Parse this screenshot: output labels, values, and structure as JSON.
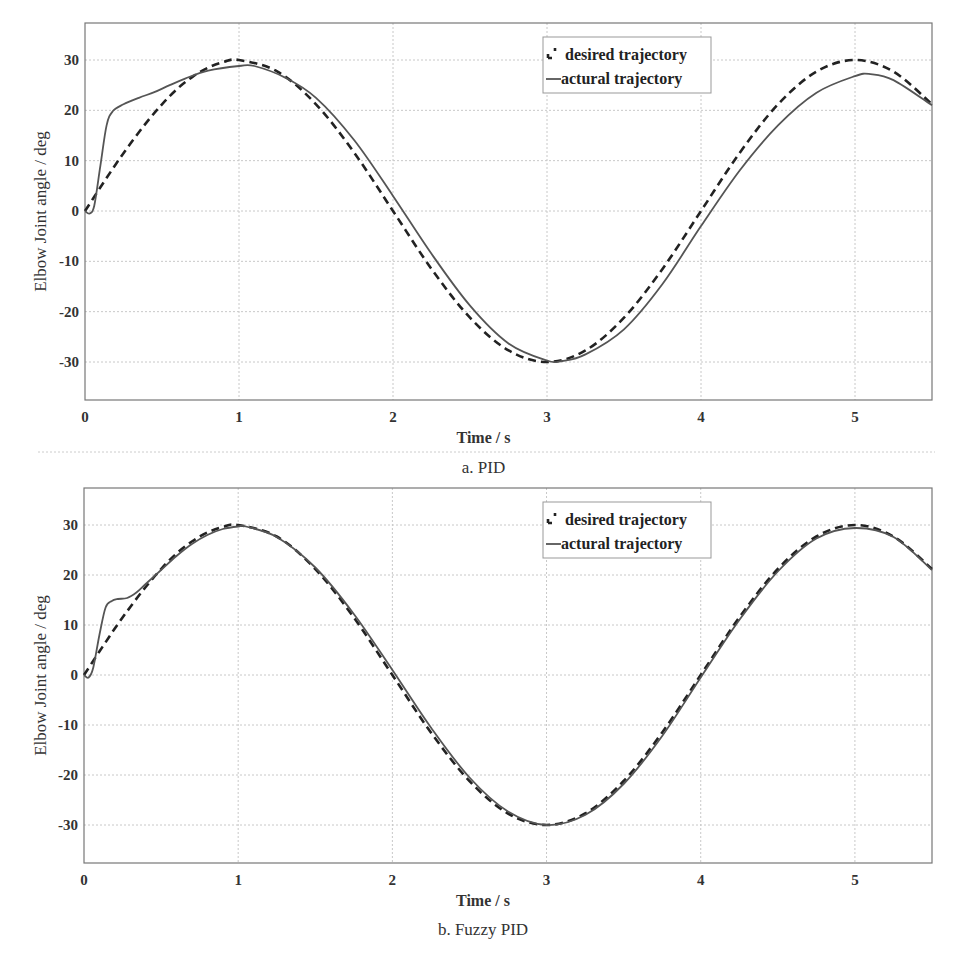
{
  "chart_data": [
    {
      "type": "line",
      "id": "pid",
      "caption": "a. PID",
      "title": "",
      "xlabel": "Time / s",
      "ylabel": "Elbow Joint angle / deg",
      "xlim": [
        0,
        5.5
      ],
      "ylim": [
        -37.5,
        37.5
      ],
      "xticks": [
        0,
        1,
        2,
        3,
        4,
        5
      ],
      "yticks": [
        -30,
        -20,
        -10,
        0,
        10,
        20,
        30
      ],
      "grid": true,
      "legend_position": "upper-center-right",
      "legend": [
        "desired trajectory",
        "actural trajectory"
      ],
      "series": [
        {
          "name": "desired trajectory",
          "style": "dashed",
          "x": [
            0,
            0.1,
            0.2,
            0.3,
            0.4,
            0.5,
            0.6,
            0.7,
            0.8,
            0.9,
            1.0,
            1.25,
            1.5,
            1.75,
            2.0,
            2.25,
            2.5,
            2.75,
            3.0,
            3.25,
            3.5,
            3.75,
            4.0,
            4.25,
            4.5,
            4.75,
            5.0,
            5.25,
            5.5
          ],
          "y": [
            0,
            4.7,
            9.3,
            13.6,
            17.6,
            21.2,
            24.3,
            26.7,
            28.5,
            29.6,
            30.0,
            27.7,
            21.2,
            11.5,
            0,
            -11.5,
            -21.2,
            -27.7,
            -30.0,
            -27.7,
            -21.2,
            -11.5,
            0,
            11.5,
            21.2,
            27.7,
            30.0,
            27.7,
            21.2
          ]
        },
        {
          "name": "actural trajectory",
          "style": "solid",
          "x": [
            0,
            0.03,
            0.06,
            0.1,
            0.14,
            0.18,
            0.25,
            0.35,
            0.45,
            0.55,
            0.65,
            0.8,
            1.0,
            1.1,
            1.3,
            1.5,
            1.75,
            2.0,
            2.25,
            2.5,
            2.75,
            3.0,
            3.1,
            3.25,
            3.5,
            3.75,
            4.0,
            4.25,
            4.5,
            4.75,
            5.0,
            5.1,
            5.25,
            5.5
          ],
          "y": [
            0,
            -0.5,
            1.0,
            9.0,
            17.0,
            19.8,
            21.2,
            22.5,
            23.6,
            25.0,
            26.3,
            27.9,
            28.8,
            28.8,
            26.5,
            22.5,
            14.0,
            3.0,
            -8.5,
            -18.8,
            -26.3,
            -29.7,
            -29.8,
            -28.5,
            -23.5,
            -14.5,
            -3.0,
            8.0,
            17.0,
            23.5,
            26.8,
            27.2,
            26.0,
            21.0
          ]
        }
      ]
    },
    {
      "type": "line",
      "id": "fuzzy_pid",
      "caption": "b. Fuzzy PID",
      "title": "",
      "xlabel": "Time / s",
      "ylabel": "Elbow Joint angle / deg",
      "xlim": [
        0,
        5.5
      ],
      "ylim": [
        -37.5,
        37.5
      ],
      "xticks": [
        0,
        1,
        2,
        3,
        4,
        5
      ],
      "yticks": [
        -30,
        -20,
        -10,
        0,
        10,
        20,
        30
      ],
      "grid": true,
      "legend_position": "upper-center-right",
      "legend": [
        "desired trajectory",
        "actural trajectory"
      ],
      "series": [
        {
          "name": "desired trajectory",
          "style": "dashed",
          "x": [
            0,
            0.1,
            0.2,
            0.3,
            0.4,
            0.5,
            0.6,
            0.7,
            0.8,
            0.9,
            1.0,
            1.25,
            1.5,
            1.75,
            2.0,
            2.25,
            2.5,
            2.75,
            3.0,
            3.25,
            3.5,
            3.75,
            4.0,
            4.25,
            4.5,
            4.75,
            5.0,
            5.25,
            5.5
          ],
          "y": [
            0,
            4.7,
            9.3,
            13.6,
            17.6,
            21.2,
            24.3,
            26.7,
            28.5,
            29.6,
            30.0,
            27.7,
            21.2,
            11.5,
            0,
            -11.5,
            -21.2,
            -27.7,
            -30.0,
            -27.7,
            -21.2,
            -11.5,
            0,
            11.5,
            21.2,
            27.7,
            30.0,
            27.7,
            21.2
          ]
        },
        {
          "name": "actural trajectory",
          "style": "solid",
          "x": [
            0,
            0.03,
            0.06,
            0.1,
            0.14,
            0.18,
            0.22,
            0.28,
            0.34,
            0.4,
            0.5,
            0.6,
            0.7,
            0.8,
            0.9,
            1.0,
            1.05,
            1.25,
            1.5,
            1.75,
            2.0,
            2.25,
            2.5,
            2.75,
            3.0,
            3.25,
            3.5,
            3.75,
            4.0,
            4.25,
            4.5,
            4.75,
            5.0,
            5.25,
            5.5
          ],
          "y": [
            0,
            -0.5,
            1.5,
            8.0,
            13.5,
            14.8,
            15.2,
            15.4,
            16.5,
            18.2,
            21.0,
            23.8,
            26.2,
            28.0,
            29.2,
            29.7,
            29.7,
            27.6,
            21.5,
            12.2,
            1.0,
            -10.5,
            -20.5,
            -27.3,
            -30.0,
            -28.0,
            -21.8,
            -12.2,
            -0.5,
            11.0,
            20.7,
            27.3,
            29.4,
            27.6,
            21.0
          ]
        }
      ]
    }
  ]
}
